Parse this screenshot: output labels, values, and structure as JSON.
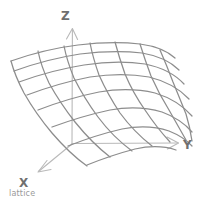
{
  "figure": {
    "title_caption": "lattice",
    "type": "3d-surface-mesh",
    "style": "hand-drawn-sketch",
    "colors": {
      "background": "#ffffff",
      "mesh_stroke": "#8d8d8d",
      "axis_stroke": "#b9b9b9",
      "label_fill": "#6f6f6f",
      "caption_fill": "#9a9a9a"
    },
    "axes": [
      {
        "id": "z",
        "label": "Z",
        "direction": "up",
        "arrow": true,
        "start": [
          72,
          143
        ],
        "end": [
          72,
          28
        ],
        "label_pos": [
          62,
          18
        ]
      },
      {
        "id": "y",
        "label": "Y",
        "direction": "right",
        "arrow": true,
        "start": [
          72,
          143
        ],
        "end": [
          178,
          143
        ],
        "label_pos": [
          183,
          148
        ]
      },
      {
        "id": "x",
        "label": "X",
        "direction": "down-left",
        "arrow": true,
        "start": [
          72,
          143
        ],
        "end": [
          38,
          172
        ],
        "label_pos": [
          22,
          186
        ]
      }
    ],
    "mesh": {
      "u_lines": 7,
      "v_lines": 8,
      "description": "curved quadrilateral lattice surface, high on the left-back, folding down steeply on the right-front"
    }
  }
}
